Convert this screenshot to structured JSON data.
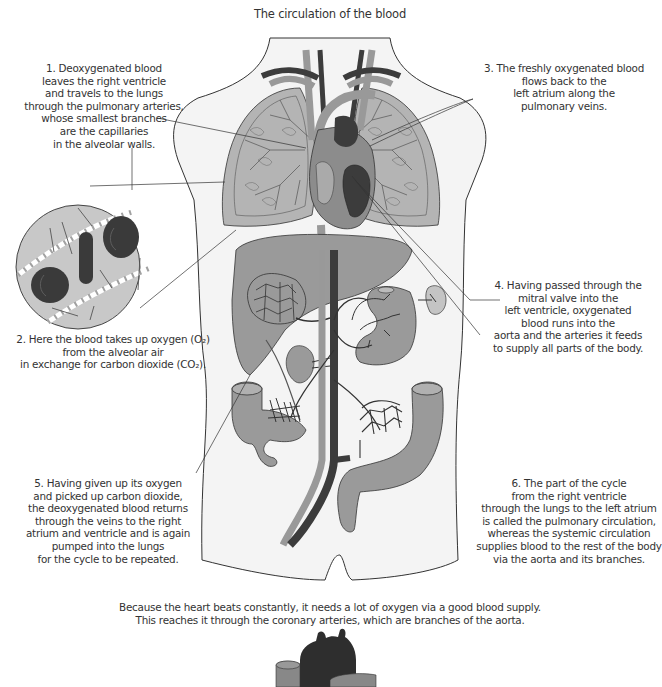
{
  "title": "The circulation of the blood",
  "colors": {
    "body_fill": "#f4f4f4",
    "outline": "#333333",
    "organ_gray": "#9a9a9a",
    "light_organ": "#c4c4c4",
    "vein_dark": "#3c3c3c",
    "artery_gray": "#8c8c8c",
    "background": "#ffffff"
  },
  "captions": [
    {
      "id": "step-1",
      "number": "1",
      "lines": [
        "1. Deoxygenated blood",
        "leaves the right ventricle",
        "and travels to the lungs",
        "through the pulmonary arteries,",
        "whose smallest branches",
        "are the capillaries",
        "in the alveolar walls."
      ]
    },
    {
      "id": "step-2",
      "number": "2",
      "lines": [
        "2. Here the blood takes up oxygen (O₂)",
        "from the alveolar air",
        "in exchange for carbon dioxide (CO₂)."
      ]
    },
    {
      "id": "step-3",
      "number": "3",
      "lines": [
        "3. The freshly oxygenated blood",
        "flows back to the",
        "left atrium along the",
        "pulmonary veins."
      ]
    },
    {
      "id": "step-4",
      "number": "4",
      "lines": [
        "4. Having passed through the",
        "mitral valve into the",
        "left ventricle, oxygenated",
        "blood runs into the",
        "aorta and the arteries it feeds",
        "to supply all parts of the body."
      ]
    },
    {
      "id": "step-5",
      "number": "5",
      "lines": [
        "5. Having given up its oxygen",
        "and picked up carbon dioxide,",
        "the deoxygenated blood returns",
        "through the veins to the right",
        "atrium and ventricle and is again",
        "pumped into the lungs",
        "for the cycle to be repeated."
      ]
    },
    {
      "id": "step-6",
      "number": "6",
      "lines": [
        "6. The part of the cycle",
        "from the right ventricle",
        "through the lungs to the left atrium",
        "is called the pulmonary circulation,",
        "whereas the systemic circulation",
        "supplies blood to the rest of the body",
        "via the aorta and its branches."
      ]
    }
  ],
  "footer": {
    "lines": [
      "Because the heart beats constantly, it needs a lot of oxygen via a good blood supply.",
      "This reaches it through the coronary arteries, which are branches of the aorta."
    ]
  },
  "illustration": {
    "regions": [
      "torso-outline",
      "lungs",
      "heart",
      "liver",
      "stomach",
      "spleen",
      "kidney",
      "intestine",
      "aorta",
      "vena-cava",
      "alveolus-magnified",
      "coronary-heart"
    ]
  }
}
